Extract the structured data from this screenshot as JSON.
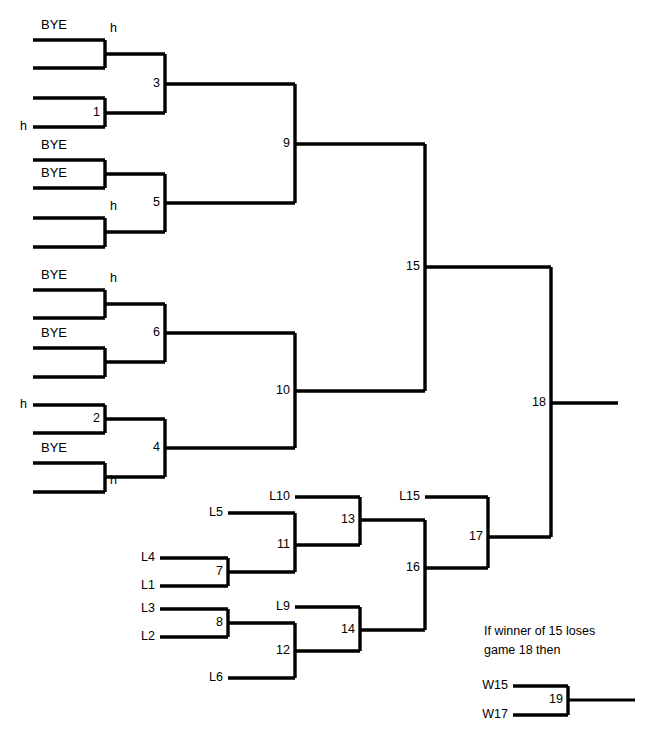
{
  "diagram": {
    "line_color": "#000000",
    "background_color": "#ffffff"
  },
  "note": {
    "line1": "If winner of 15 loses",
    "line2": "game 18 then"
  },
  "winners_bracket": {
    "seeds": [
      {
        "id": "w-r1-1a",
        "label": "",
        "bye": "BYE",
        "h": "h",
        "x1": 33,
        "x2": 105,
        "y": 40
      },
      {
        "id": "w-r1-1b",
        "label": "",
        "bye": "",
        "h": "",
        "x1": 33,
        "x2": 105,
        "y": 68
      },
      {
        "id": "w-r1-2a",
        "label": "",
        "bye": "",
        "h": "",
        "x1": 33,
        "x2": 105,
        "y": 98
      },
      {
        "id": "w-r1-2b",
        "label": "h",
        "bye": "",
        "h": "",
        "x1": 33,
        "x2": 105,
        "y": 127
      },
      {
        "id": "w-r1-3a",
        "label": "",
        "bye": "BYE",
        "h": "",
        "x1": 33,
        "x2": 105,
        "y": 160
      },
      {
        "id": "w-r1-3b",
        "label": "",
        "bye": "BYE",
        "h": "",
        "x1": 33,
        "x2": 105,
        "y": 188
      },
      {
        "id": "w-r1-4a",
        "label": "",
        "bye": "",
        "h": "h",
        "x1": 33,
        "x2": 105,
        "y": 218
      },
      {
        "id": "w-r1-4b",
        "label": "",
        "bye": "",
        "h": "",
        "x1": 33,
        "x2": 105,
        "y": 247
      },
      {
        "id": "w-r1-5a",
        "label": "",
        "bye": "BYE",
        "h": "h",
        "x1": 33,
        "x2": 105,
        "y": 290
      },
      {
        "id": "w-r1-5b",
        "label": "",
        "bye": "",
        "h": "",
        "x1": 33,
        "x2": 105,
        "y": 318
      },
      {
        "id": "w-r1-6a",
        "label": "",
        "bye": "BYE",
        "h": "",
        "x1": 33,
        "x2": 105,
        "y": 348
      },
      {
        "id": "w-r1-6b",
        "label": "",
        "bye": "",
        "h": "",
        "x1": 33,
        "x2": 105,
        "y": 377
      },
      {
        "id": "w-r1-7a",
        "label": "h",
        "bye": "",
        "h": "",
        "x1": 33,
        "x2": 105,
        "y": 405
      },
      {
        "id": "w-r1-7b",
        "label": "",
        "bye": "",
        "h": "",
        "x1": 33,
        "x2": 105,
        "y": 433
      },
      {
        "id": "w-r1-8a",
        "label": "",
        "bye": "BYE",
        "h": "",
        "x1": 33,
        "x2": 105,
        "y": 463
      },
      {
        "id": "w-r1-8b",
        "label": "",
        "bye": "",
        "h": "h",
        "x1": 33,
        "x2": 105,
        "y": 492
      }
    ],
    "bye_text": "BYE",
    "h_text": "h",
    "games": [
      {
        "number": "1",
        "x": 105,
        "y_top": 98,
        "y_bot": 127,
        "out_y": 113,
        "out_x2": 165
      },
      {
        "number": "2",
        "x": 105,
        "y_top": 405,
        "y_bot": 433,
        "out_y": 419,
        "out_x2": 165
      },
      {
        "number": "3",
        "x": 165,
        "y_top": 54,
        "y_bot": 113,
        "out_y": 84,
        "out_x2": 295
      },
      {
        "number": "4",
        "x": 165,
        "y_top": 419,
        "y_bot": 477,
        "out_y": 448,
        "out_x2": 295
      },
      {
        "number": "5",
        "x": 165,
        "y_top": 174,
        "y_bot": 232,
        "out_y": 203,
        "out_x2": 295
      },
      {
        "number": "6",
        "x": 165,
        "y_top": 304,
        "y_bot": 362,
        "out_y": 333,
        "out_x2": 295
      },
      {
        "number": "9",
        "x": 295,
        "y_top": 84,
        "y_bot": 203,
        "out_y": 144,
        "out_x2": 425
      },
      {
        "number": "10",
        "x": 295,
        "y_top": 333,
        "y_bot": 448,
        "out_y": 391,
        "out_x2": 425
      },
      {
        "number": "15",
        "x": 425,
        "y_top": 144,
        "y_bot": 391,
        "out_y": 267,
        "out_x2": 551
      },
      {
        "number": "18",
        "x": 551,
        "y_top": 267,
        "y_bot": 537,
        "out_y": 403,
        "out_x2": 618
      }
    ],
    "hidden_connectors": [
      {
        "x": 105,
        "y_top": 40,
        "y_bot": 68
      },
      {
        "x": 105,
        "y_top": 160,
        "y_bot": 188
      },
      {
        "x": 105,
        "y_top": 218,
        "y_bot": 247
      },
      {
        "x": 105,
        "y_top": 290,
        "y_bot": 318
      },
      {
        "x": 105,
        "y_top": 348,
        "y_bot": 377
      },
      {
        "x": 105,
        "y_top": 463,
        "y_bot": 492
      }
    ],
    "stub_outs": [
      {
        "x1": 105,
        "x2": 165,
        "y": 54
      },
      {
        "x1": 105,
        "x2": 165,
        "y": 174
      },
      {
        "x1": 105,
        "x2": 165,
        "y": 232
      },
      {
        "x1": 105,
        "x2": 165,
        "y": 304
      },
      {
        "x1": 105,
        "x2": 165,
        "y": 362
      },
      {
        "x1": 105,
        "x2": 165,
        "y": 477
      }
    ]
  },
  "losers_bracket": {
    "seeds": [
      {
        "id": "l-L5",
        "label": "L5",
        "x1": 228,
        "x2": 295,
        "y": 513
      },
      {
        "id": "l-L4",
        "label": "L4",
        "x1": 160,
        "x2": 228,
        "y": 558
      },
      {
        "id": "l-L1",
        "label": "L1",
        "x1": 160,
        "x2": 228,
        "y": 586
      },
      {
        "id": "l-L3",
        "label": "L3",
        "x1": 160,
        "x2": 228,
        "y": 609
      },
      {
        "id": "l-L2",
        "label": "L2",
        "x1": 160,
        "x2": 228,
        "y": 637
      },
      {
        "id": "l-L6",
        "label": "L6",
        "x1": 228,
        "x2": 295,
        "y": 678
      },
      {
        "id": "l-L10",
        "label": "L10",
        "x1": 295,
        "x2": 360,
        "y": 497
      },
      {
        "id": "l-L9",
        "label": "L9",
        "x1": 295,
        "x2": 360,
        "y": 607
      },
      {
        "id": "l-L15",
        "label": "L15",
        "x1": 425,
        "x2": 488,
        "y": 497
      }
    ],
    "games": [
      {
        "number": "7",
        "x": 228,
        "y_top": 558,
        "y_bot": 586,
        "out_y": 572,
        "out_x2": 295
      },
      {
        "number": "8",
        "x": 228,
        "y_top": 609,
        "y_bot": 637,
        "out_y": 623,
        "out_x2": 295
      },
      {
        "number": "11",
        "x": 295,
        "y_top": 513,
        "y_bot": 572,
        "out_y": 545,
        "out_x2": 360
      },
      {
        "number": "12",
        "x": 295,
        "y_top": 623,
        "y_bot": 678,
        "out_y": 651,
        "out_x2": 360
      },
      {
        "number": "13",
        "x": 360,
        "y_top": 497,
        "y_bot": 545,
        "out_y": 520,
        "out_x2": 425
      },
      {
        "number": "14",
        "x": 360,
        "y_top": 607,
        "y_bot": 651,
        "out_y": 630,
        "out_x2": 425
      },
      {
        "number": "16",
        "x": 425,
        "y_top": 520,
        "y_bot": 630,
        "out_y": 568,
        "out_x2": 488
      },
      {
        "number": "17",
        "x": 488,
        "y_top": 497,
        "y_bot": 568,
        "out_y": 537,
        "out_x2": 551
      }
    ]
  },
  "consolation": {
    "seeds": [
      {
        "id": "c-W15",
        "label": "W15",
        "x1": 513,
        "x2": 568,
        "y": 686
      },
      {
        "id": "c-W17",
        "label": "W17",
        "x1": 513,
        "x2": 568,
        "y": 715
      }
    ],
    "games": [
      {
        "number": "19",
        "x": 568,
        "y_top": 686,
        "y_bot": 715,
        "out_y": 700,
        "out_x2": 635
      }
    ]
  }
}
